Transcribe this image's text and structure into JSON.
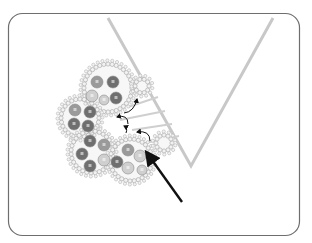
{
  "figure": {
    "width": 312,
    "height": 243,
    "frame": {
      "x": 8.5,
      "y": 13.5,
      "w": 291,
      "h": 222,
      "rx": 14,
      "stroke": "#6e6e6e"
    },
    "colors": {
      "wedge": "#c8c8c8",
      "bridge": "#cfcfcf",
      "bead_fill": "#f2f2f2",
      "bead_stroke": "#b5b5b5",
      "blob_fill": "#f7f7f7",
      "arrow": "#111111",
      "sphere_dark": "#6f6f6f",
      "sphere_mid": "#9a9a9a",
      "sphere_light": "#cfcfcf"
    },
    "wedge": {
      "points": [
        [
          108,
          18
        ],
        [
          191,
          166
        ],
        [
          273,
          18
        ]
      ],
      "stroke_width": 3
    },
    "bridges": [
      [
        [
          130,
          93
        ],
        [
          150,
          83
        ]
      ],
      [
        [
          128,
          107
        ],
        [
          158,
          97
        ]
      ],
      [
        [
          120,
          120
        ],
        [
          165,
          111
        ]
      ],
      [
        [
          132,
          130
        ],
        [
          172,
          124
        ]
      ],
      [
        [
          140,
          144
        ],
        [
          179,
          136
        ]
      ]
    ],
    "blobs": [
      {
        "name": "cluster-lobe-top",
        "cx": 108,
        "cy": 88,
        "r": 24
      },
      {
        "name": "cluster-lobe-left",
        "cx": 80,
        "cy": 118,
        "r": 19
      },
      {
        "name": "cluster-lobe-bottom-left",
        "cx": 92,
        "cy": 152,
        "r": 21
      },
      {
        "name": "cluster-lobe-bottom-right",
        "cx": 131,
        "cy": 160,
        "r": 21
      },
      {
        "name": "surface-bud-top",
        "cx": 142,
        "cy": 86,
        "r": 7
      },
      {
        "name": "surface-bud-bottom",
        "cx": 164,
        "cy": 143,
        "r": 8
      }
    ],
    "spheres": [
      {
        "cx": 97,
        "cy": 82,
        "r": 6,
        "tone": "sphere_mid"
      },
      {
        "cx": 113,
        "cy": 82,
        "r": 6,
        "tone": "sphere_dark"
      },
      {
        "cx": 92,
        "cy": 96,
        "r": 6,
        "tone": "sphere_light"
      },
      {
        "cx": 116,
        "cy": 98,
        "r": 6,
        "tone": "sphere_dark"
      },
      {
        "cx": 104,
        "cy": 100,
        "r": 5,
        "tone": "sphere_light"
      },
      {
        "cx": 75,
        "cy": 110,
        "r": 6,
        "tone": "sphere_mid"
      },
      {
        "cx": 90,
        "cy": 112,
        "r": 6,
        "tone": "sphere_dark"
      },
      {
        "cx": 74,
        "cy": 124,
        "r": 6,
        "tone": "sphere_dark"
      },
      {
        "cx": 88,
        "cy": 126,
        "r": 6,
        "tone": "sphere_dark"
      },
      {
        "cx": 90,
        "cy": 141,
        "r": 6,
        "tone": "sphere_dark"
      },
      {
        "cx": 104,
        "cy": 145,
        "r": 6,
        "tone": "sphere_mid"
      },
      {
        "cx": 82,
        "cy": 154,
        "r": 6,
        "tone": "sphere_dark"
      },
      {
        "cx": 104,
        "cy": 160,
        "r": 6,
        "tone": "sphere_light"
      },
      {
        "cx": 90,
        "cy": 166,
        "r": 6,
        "tone": "sphere_dark"
      },
      {
        "cx": 117,
        "cy": 162,
        "r": 6,
        "tone": "sphere_dark"
      },
      {
        "cx": 128,
        "cy": 150,
        "r": 6,
        "tone": "sphere_mid"
      },
      {
        "cx": 140,
        "cy": 156,
        "r": 6,
        "tone": "sphere_light"
      },
      {
        "cx": 128,
        "cy": 168,
        "r": 6,
        "tone": "sphere_light"
      },
      {
        "cx": 142,
        "cy": 170,
        "r": 5,
        "tone": "sphere_light"
      }
    ],
    "small_arrows": [
      {
        "d": "M124 113 Q134 112 137 99"
      },
      {
        "d": "M128 124 Q128 114 117 117"
      },
      {
        "d": "M150 141 Q150 130 137 132"
      },
      {
        "d": "M126 133 Q128 128 124 126"
      }
    ],
    "main_arrow": {
      "from": [
        182,
        202
      ],
      "to": [
        147,
        153
      ]
    },
    "caption": ""
  }
}
